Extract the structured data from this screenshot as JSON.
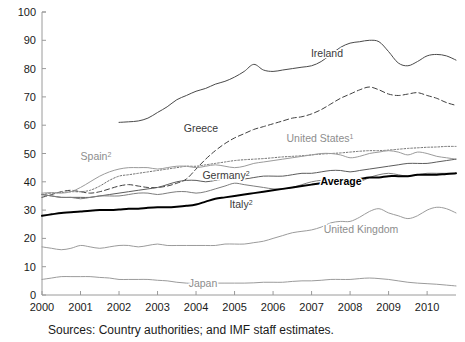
{
  "chart_data": {
    "type": "line",
    "title": "",
    "subtitle": "",
    "xlabel": "",
    "ylabel": "",
    "xlim": [
      2000.0,
      2010.75
    ],
    "ylim": [
      0,
      100
    ],
    "yticks": [
      0,
      10,
      20,
      30,
      40,
      50,
      60,
      70,
      80,
      90,
      100
    ],
    "xticks": [
      "2000",
      "2001",
      "2002",
      "2003",
      "2004",
      "2005",
      "2006",
      "2007",
      "2008",
      "2009",
      "2010"
    ],
    "grid": false,
    "legend_position": "inline-labels",
    "source_note": "Sources: Country authorities; and IMF staff estimates.",
    "footnotes": [
      "1",
      "2"
    ],
    "series": [
      {
        "name": "Ireland",
        "label": "Ireland",
        "style": "solid",
        "color": "#4a4a4a",
        "width": 1.0,
        "label_bold": false,
        "label_x": 327,
        "label_y": 57,
        "x": [
          2002.0,
          2002.25,
          2002.5,
          2002.75,
          2003.0,
          2003.25,
          2003.5,
          2003.75,
          2004.0,
          2004.25,
          2004.5,
          2004.75,
          2005.0,
          2005.25,
          2005.5,
          2005.75,
          2006.0,
          2006.25,
          2006.5,
          2006.75,
          2007.0,
          2007.25,
          2007.5,
          2007.75,
          2008.0,
          2008.25,
          2008.5,
          2008.75,
          2009.0,
          2009.25,
          2009.5,
          2009.75,
          2010.0,
          2010.25,
          2010.5,
          2010.75
        ],
        "y": [
          61.0,
          61.2,
          61.5,
          62.5,
          64.5,
          66.5,
          69.0,
          70.5,
          72.0,
          73.0,
          74.5,
          75.5,
          77.0,
          79.0,
          81.5,
          79.5,
          79.0,
          79.5,
          80.0,
          80.5,
          81.0,
          82.5,
          85.0,
          87.5,
          89.0,
          89.5,
          90.0,
          89.5,
          86.0,
          82.0,
          81.0,
          82.5,
          84.5,
          85.0,
          84.5,
          83.0
        ]
      },
      {
        "name": "Greece",
        "label": "Greece",
        "style": "dashed",
        "color": "#3f3f3f",
        "width": 1.0,
        "label_bold": false,
        "label_x": 201,
        "label_y": 132,
        "x": [
          2000.0,
          2000.25,
          2000.5,
          2000.75,
          2001.0,
          2001.25,
          2001.5,
          2001.75,
          2002.0,
          2002.25,
          2002.5,
          2002.75,
          2003.0,
          2003.25,
          2003.5,
          2003.75,
          2004.0,
          2004.25,
          2004.5,
          2004.75,
          2005.0,
          2005.25,
          2005.5,
          2005.75,
          2006.0,
          2006.25,
          2006.5,
          2006.75,
          2007.0,
          2007.25,
          2007.5,
          2007.75,
          2008.0,
          2008.25,
          2008.5,
          2008.75,
          2009.0,
          2009.25,
          2009.5,
          2009.75,
          2010.0,
          2010.25,
          2010.5,
          2010.75
        ],
        "y": [
          34.5,
          35.5,
          36.5,
          37.0,
          36.5,
          36.0,
          36.5,
          37.5,
          38.5,
          39.0,
          38.5,
          38.0,
          38.0,
          38.5,
          39.5,
          41.0,
          44.5,
          48.0,
          51.0,
          53.5,
          55.5,
          57.0,
          58.5,
          59.5,
          60.5,
          61.5,
          62.5,
          63.0,
          64.0,
          65.5,
          67.5,
          69.5,
          71.0,
          72.5,
          73.5,
          72.5,
          71.0,
          70.5,
          71.0,
          71.5,
          70.5,
          69.5,
          68.0,
          67.0
        ]
      },
      {
        "name": "United States",
        "label": "United States",
        "label_sup": "1",
        "style": "dotted",
        "color": "#6f6f6f",
        "width": 1.0,
        "label_bold": false,
        "label_x": 320,
        "label_y": 142,
        "x": [
          2000.0,
          2000.25,
          2000.5,
          2000.75,
          2001.0,
          2001.25,
          2001.5,
          2001.75,
          2002.0,
          2002.25,
          2002.5,
          2002.75,
          2003.0,
          2003.25,
          2003.5,
          2003.75,
          2004.0,
          2004.25,
          2004.5,
          2004.75,
          2005.0,
          2005.25,
          2005.5,
          2005.75,
          2006.0,
          2006.25,
          2006.5,
          2006.75,
          2007.0,
          2007.25,
          2007.5,
          2007.75,
          2008.0,
          2008.25,
          2008.5,
          2008.75,
          2009.0,
          2009.25,
          2009.5,
          2009.75,
          2010.0,
          2010.25,
          2010.5,
          2010.75
        ],
        "y": [
          35.5,
          36.0,
          36.2,
          36.5,
          36.5,
          37.0,
          38.5,
          40.5,
          42.0,
          42.5,
          43.0,
          43.5,
          44.0,
          44.5,
          45.0,
          45.5,
          45.5,
          46.0,
          46.5,
          47.0,
          47.5,
          47.8,
          48.0,
          48.2,
          48.5,
          48.8,
          49.0,
          49.2,
          49.5,
          49.8,
          50.0,
          50.2,
          50.5,
          50.8,
          51.0,
          51.0,
          51.2,
          51.5,
          51.8,
          52.0,
          52.2,
          52.3,
          52.5,
          52.5
        ]
      },
      {
        "name": "Spain",
        "label": "Spain",
        "label_sup": "2",
        "style": "solid",
        "color": "#9b9b9b",
        "width": 1.0,
        "label_bold": false,
        "label_x": 96,
        "label_y": 160,
        "x": [
          2000.0,
          2000.25,
          2000.5,
          2000.75,
          2001.0,
          2001.25,
          2001.5,
          2001.75,
          2002.0,
          2002.25,
          2002.5,
          2002.75,
          2003.0,
          2003.25,
          2003.5,
          2003.75,
          2004.0,
          2004.25,
          2004.5,
          2004.75,
          2005.0,
          2005.25,
          2005.5,
          2005.75,
          2006.0,
          2006.25,
          2006.5,
          2006.75,
          2007.0,
          2007.25,
          2007.5,
          2007.75,
          2008.0,
          2008.25,
          2008.5,
          2008.75,
          2009.0,
          2009.25,
          2009.5,
          2009.75,
          2010.0,
          2010.25,
          2010.5,
          2010.75
        ],
        "y": [
          36.0,
          36.2,
          36.0,
          36.5,
          38.0,
          40.0,
          42.0,
          43.5,
          44.5,
          45.0,
          45.0,
          45.0,
          44.5,
          45.0,
          45.5,
          45.5,
          45.0,
          45.5,
          46.0,
          45.5,
          45.0,
          45.5,
          46.5,
          47.0,
          47.5,
          48.0,
          48.5,
          49.0,
          49.5,
          50.0,
          50.0,
          49.5,
          48.5,
          49.0,
          50.0,
          50.5,
          51.0,
          50.5,
          49.5,
          50.5,
          50.0,
          49.0,
          48.5,
          48.0
        ]
      },
      {
        "name": "Germany",
        "label": "Germany",
        "label_sup": "2",
        "style": "solid",
        "color": "#5c5c5c",
        "width": 1.0,
        "label_bold": false,
        "label_x": 226,
        "label_y": 179,
        "x": [
          2000.0,
          2000.25,
          2000.5,
          2000.75,
          2001.0,
          2001.25,
          2001.5,
          2001.75,
          2002.0,
          2002.25,
          2002.5,
          2002.75,
          2003.0,
          2003.25,
          2003.5,
          2003.75,
          2004.0,
          2004.25,
          2004.5,
          2004.75,
          2005.0,
          2005.25,
          2005.5,
          2005.75,
          2006.0,
          2006.25,
          2006.5,
          2006.75,
          2007.0,
          2007.25,
          2007.5,
          2007.75,
          2008.0,
          2008.25,
          2008.5,
          2008.75,
          2009.0,
          2009.25,
          2009.5,
          2009.75,
          2010.0,
          2010.25,
          2010.5,
          2010.75
        ],
        "y": [
          35.5,
          35.0,
          34.5,
          34.5,
          34.5,
          34.5,
          35.0,
          35.5,
          36.0,
          36.5,
          37.0,
          37.5,
          38.0,
          39.0,
          40.0,
          40.5,
          40.5,
          40.0,
          40.5,
          41.0,
          41.0,
          41.0,
          41.5,
          42.0,
          42.0,
          42.0,
          42.5,
          43.0,
          43.0,
          43.5,
          44.0,
          44.0,
          43.5,
          44.0,
          44.5,
          45.0,
          45.5,
          46.0,
          46.5,
          46.5,
          46.5,
          47.0,
          47.5,
          48.0
        ]
      },
      {
        "name": "Italy",
        "label": "Italy",
        "label_sup": "2",
        "style": "solid",
        "color": "#7d7d7d",
        "width": 1.0,
        "label_bold": false,
        "label_x": 241,
        "label_y": 208,
        "x": [
          2000.0,
          2000.25,
          2000.5,
          2000.75,
          2001.0,
          2001.25,
          2001.5,
          2001.75,
          2002.0,
          2002.25,
          2002.5,
          2002.75,
          2003.0,
          2003.25,
          2003.5,
          2003.75,
          2004.0,
          2004.25,
          2004.5,
          2004.75,
          2005.0,
          2005.25,
          2005.5,
          2005.75,
          2006.0,
          2006.25,
          2006.5,
          2006.75,
          2007.0,
          2007.25,
          2007.5,
          2007.75,
          2008.0,
          2008.25,
          2008.5,
          2008.75,
          2009.0,
          2009.25,
          2009.5,
          2009.75,
          2010.0,
          2010.25,
          2010.5,
          2010.75
        ],
        "y": [
          35.5,
          35.0,
          34.5,
          34.5,
          34.0,
          34.5,
          35.0,
          35.0,
          35.0,
          35.5,
          36.0,
          36.0,
          35.5,
          36.0,
          36.5,
          36.5,
          36.0,
          36.5,
          37.5,
          38.5,
          39.5,
          39.0,
          38.5,
          38.0,
          37.5,
          37.5,
          38.0,
          39.0,
          40.0,
          40.5,
          40.5,
          40.0,
          39.5,
          40.0,
          41.5,
          42.5,
          43.0,
          42.5,
          42.0,
          42.5,
          43.0,
          43.0,
          43.0,
          43.0
        ]
      },
      {
        "name": "Average",
        "label": "Average",
        "style": "solid",
        "color": "#000000",
        "width": 2.0,
        "label_bold": true,
        "label_x": 341,
        "label_y": 185,
        "x": [
          2000.0,
          2000.25,
          2000.5,
          2000.75,
          2001.0,
          2001.25,
          2001.5,
          2001.75,
          2002.0,
          2002.25,
          2002.5,
          2002.75,
          2003.0,
          2003.25,
          2003.5,
          2003.75,
          2004.0,
          2004.25,
          2004.5,
          2004.75,
          2005.0,
          2005.25,
          2005.5,
          2005.75,
          2006.0,
          2006.25,
          2006.5,
          2006.75,
          2007.0,
          2007.25,
          2007.5,
          2007.75,
          2008.0,
          2008.25,
          2008.5,
          2008.75,
          2009.0,
          2009.25,
          2009.5,
          2009.75,
          2010.0,
          2010.25,
          2010.5,
          2010.75
        ],
        "y": [
          28.0,
          28.5,
          29.0,
          29.2,
          29.5,
          29.8,
          30.0,
          30.0,
          30.2,
          30.5,
          30.5,
          30.8,
          31.0,
          31.0,
          31.2,
          31.5,
          32.0,
          33.0,
          34.0,
          34.5,
          35.0,
          35.5,
          36.0,
          36.5,
          37.0,
          37.5,
          38.0,
          38.5,
          39.0,
          39.5,
          40.0,
          40.0,
          40.5,
          41.0,
          41.5,
          41.5,
          42.0,
          42.0,
          42.0,
          42.5,
          42.5,
          42.5,
          42.8,
          43.0
        ]
      },
      {
        "name": "United Kingdom",
        "label": "United Kingdom",
        "style": "solid",
        "color": "#9b9b9b",
        "width": 1.0,
        "label_bold": false,
        "label_x": 361,
        "label_y": 233,
        "x": [
          2000.0,
          2000.25,
          2000.5,
          2000.75,
          2001.0,
          2001.25,
          2001.5,
          2001.75,
          2002.0,
          2002.25,
          2002.5,
          2002.75,
          2003.0,
          2003.25,
          2003.5,
          2003.75,
          2004.0,
          2004.25,
          2004.5,
          2004.75,
          2005.0,
          2005.25,
          2005.5,
          2005.75,
          2006.0,
          2006.25,
          2006.5,
          2006.75,
          2007.0,
          2007.25,
          2007.5,
          2007.75,
          2008.0,
          2008.25,
          2008.5,
          2008.75,
          2009.0,
          2009.25,
          2009.5,
          2009.75,
          2010.0,
          2010.25,
          2010.5,
          2010.75
        ],
        "y": [
          17.0,
          16.5,
          16.0,
          16.5,
          17.5,
          17.0,
          16.5,
          17.0,
          17.5,
          17.5,
          17.0,
          17.5,
          18.0,
          17.5,
          17.5,
          17.5,
          17.5,
          17.5,
          17.5,
          18.0,
          18.0,
          18.0,
          18.5,
          19.0,
          20.0,
          21.0,
          22.0,
          22.5,
          23.0,
          24.0,
          25.5,
          26.0,
          26.0,
          27.5,
          29.5,
          30.5,
          29.0,
          28.0,
          27.0,
          28.0,
          30.0,
          31.0,
          30.5,
          29.0
        ]
      },
      {
        "name": "Japan",
        "label": "Japan",
        "style": "solid",
        "color": "#9b9b9b",
        "width": 1.0,
        "label_bold": false,
        "label_x": 203,
        "label_y": 287,
        "x": [
          2000.0,
          2000.25,
          2000.5,
          2000.75,
          2001.0,
          2001.25,
          2001.5,
          2001.75,
          2002.0,
          2002.25,
          2002.5,
          2002.75,
          2003.0,
          2003.25,
          2003.5,
          2003.75,
          2004.0,
          2004.25,
          2004.5,
          2004.75,
          2005.0,
          2005.25,
          2005.5,
          2005.75,
          2006.0,
          2006.25,
          2006.5,
          2006.75,
          2007.0,
          2007.25,
          2007.5,
          2007.75,
          2008.0,
          2008.25,
          2008.5,
          2008.75,
          2009.0,
          2009.25,
          2009.5,
          2009.75,
          2010.0,
          2010.25,
          2010.5,
          2010.75
        ],
        "y": [
          5.5,
          6.0,
          6.5,
          6.5,
          6.5,
          6.5,
          6.2,
          6.0,
          5.5,
          5.5,
          5.5,
          5.5,
          5.2,
          5.0,
          4.5,
          4.2,
          4.0,
          4.0,
          4.2,
          4.2,
          4.2,
          4.2,
          4.3,
          4.5,
          4.5,
          4.5,
          4.8,
          5.0,
          5.0,
          5.2,
          5.5,
          5.5,
          5.5,
          5.8,
          6.0,
          5.8,
          5.5,
          5.0,
          4.5,
          4.2,
          4.0,
          3.8,
          3.5,
          3.2
        ]
      }
    ]
  },
  "axes": {
    "y_min_label": "0",
    "y_max_label": "100"
  }
}
